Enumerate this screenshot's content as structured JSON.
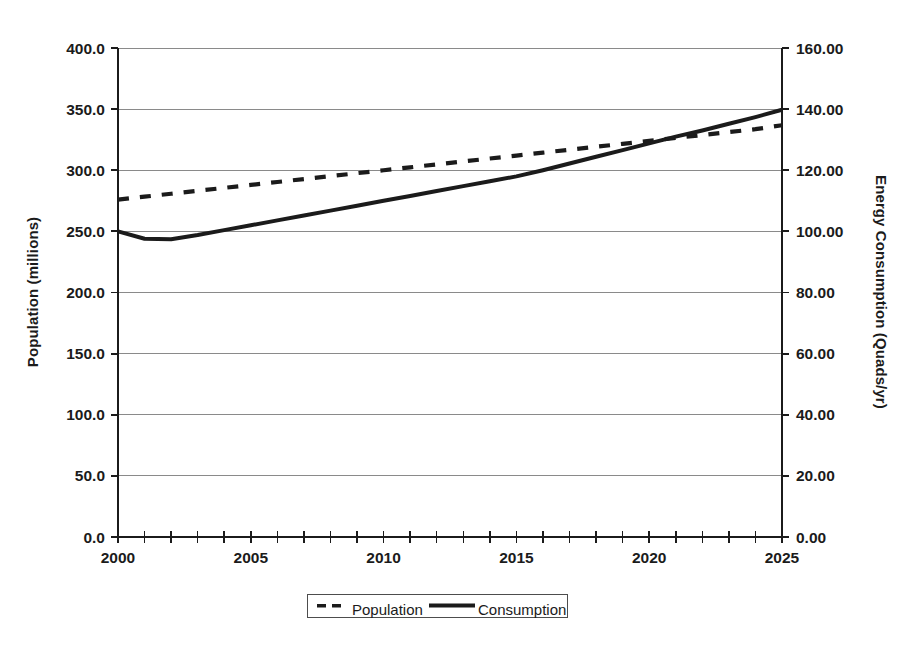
{
  "chart_data": {
    "type": "line",
    "title": "",
    "xlabel": "",
    "x": [
      2000,
      2001,
      2002,
      2003,
      2004,
      2005,
      2006,
      2007,
      2008,
      2009,
      2010,
      2011,
      2012,
      2013,
      2014,
      2015,
      2016,
      2017,
      2018,
      2019,
      2020,
      2021,
      2022,
      2023,
      2024,
      2025
    ],
    "xlim": [
      2000,
      2025
    ],
    "xtick_labels": [
      "2000",
      "2005",
      "2010",
      "2015",
      "2020",
      "2025"
    ],
    "xticks": [
      2000,
      2005,
      2010,
      2015,
      2020,
      2025
    ],
    "grid": true,
    "legend_position": "bottom",
    "left_axis": {
      "label": "Population (millions)",
      "ylim": [
        0.0,
        400.0
      ],
      "tick_labels": [
        "400.0",
        "350.0",
        "300.0",
        "250.0",
        "200.0",
        "150.0",
        "100.0",
        "50.0",
        "0.0"
      ],
      "ticks": [
        400.0,
        350.0,
        300.0,
        250.0,
        200.0,
        150.0,
        100.0,
        50.0,
        0.0
      ]
    },
    "right_axis": {
      "label": "Energy Consumption (Quads/yr)",
      "ylim": [
        0.0,
        160.0
      ],
      "tick_labels": [
        "160.00",
        "140.00",
        "120.00",
        "100.00",
        "80.00",
        "60.00",
        "40.00",
        "20.00",
        "0.00"
      ],
      "ticks": [
        160.0,
        140.0,
        120.0,
        100.0,
        80.0,
        60.0,
        40.0,
        20.0,
        0.0
      ]
    },
    "series": [
      {
        "name": "Population",
        "axis": "left",
        "style": "dashed",
        "units": "millions",
        "values": [
          276.0,
          278.4,
          280.8,
          283.2,
          285.6,
          288.0,
          290.4,
          292.8,
          295.2,
          297.6,
          300.0,
          302.4,
          304.8,
          307.2,
          309.6,
          312.0,
          314.4,
          316.8,
          319.2,
          321.6,
          324.0,
          326.4,
          328.8,
          331.2,
          333.6,
          336.8
        ]
      },
      {
        "name": "Consumption",
        "axis": "right",
        "style": "solid",
        "units": "Quads/yr",
        "values": [
          100.0,
          97.6,
          97.4,
          98.8,
          100.4,
          102.0,
          103.6,
          105.2,
          106.8,
          108.4,
          110.0,
          111.6,
          113.2,
          114.8,
          116.4,
          118.0,
          120.0,
          122.2,
          124.4,
          126.6,
          128.8,
          131.0,
          133.0,
          135.2,
          137.4,
          139.8
        ]
      }
    ]
  },
  "legend": {
    "entries": [
      {
        "label": "Population",
        "style": "dashed"
      },
      {
        "label": "Consumption",
        "style": "solid"
      }
    ]
  }
}
